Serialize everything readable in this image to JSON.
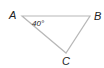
{
  "diagram": {
    "type": "triangle",
    "vertices": [
      {
        "label": "A",
        "x": 22,
        "y": 16
      },
      {
        "label": "B",
        "x": 90,
        "y": 16
      },
      {
        "label": "C",
        "x": 66,
        "y": 53
      }
    ],
    "angle_label": "40°",
    "angle_vertex": "A",
    "colors": {
      "line": "#b8b8b8",
      "text": "#222222"
    }
  }
}
